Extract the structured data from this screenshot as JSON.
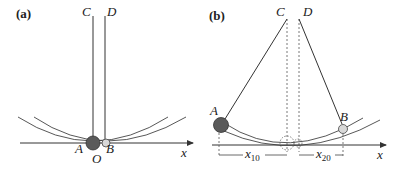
{
  "figure": {
    "panel_a": {
      "label": "(a)",
      "points": {
        "C": "C",
        "D": "D",
        "A": "A",
        "O": "O",
        "B": "B"
      },
      "axis_label": "x"
    },
    "panel_b": {
      "label": "(b)",
      "points": {
        "C": "C",
        "D": "D",
        "A": "A",
        "B": "B"
      },
      "axis_label": "x",
      "dim_1": {
        "base": "x",
        "sub": "10"
      },
      "dim_2": {
        "base": "x",
        "sub": "20"
      }
    },
    "colors": {
      "line": "#333333",
      "ball_large": "#5a5a5a",
      "ball_small": "#d8d8d8"
    }
  }
}
